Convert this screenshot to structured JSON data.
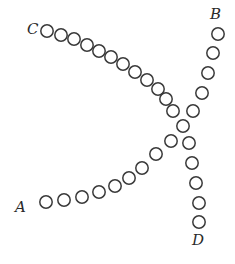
{
  "diagram": {
    "bead_radius": 6.2,
    "stroke_color": "#3a3a3a",
    "background": "#ffffff",
    "labels": [
      {
        "id": "C",
        "text": "C",
        "x": 27,
        "y": 22
      },
      {
        "id": "B",
        "text": "B",
        "x": 210,
        "y": 7
      },
      {
        "id": "A",
        "text": "A",
        "x": 15,
        "y": 200
      },
      {
        "id": "D",
        "text": "D",
        "x": 192,
        "y": 233
      }
    ],
    "arms": [
      {
        "name": "arm-c",
        "beads": [
          [
            47,
            31
          ],
          [
            61,
            35
          ],
          [
            74,
            39
          ],
          [
            87,
            45
          ],
          [
            99,
            51
          ],
          [
            111,
            57
          ],
          [
            123,
            64
          ],
          [
            135,
            72
          ],
          [
            147,
            80
          ],
          [
            158,
            89
          ],
          [
            166,
            99
          ],
          [
            173,
            111
          ]
        ]
      },
      {
        "name": "arm-b",
        "beads": [
          [
            218,
            34
          ],
          [
            213,
            53
          ],
          [
            208,
            73
          ],
          [
            202,
            93
          ],
          [
            193,
            111
          ]
        ]
      },
      {
        "name": "center",
        "beads": [
          [
            183,
            126
          ]
        ]
      },
      {
        "name": "arm-a",
        "beads": [
          [
            46,
            202
          ],
          [
            64,
            200
          ],
          [
            82,
            197
          ],
          [
            99,
            192
          ],
          [
            115,
            186
          ],
          [
            129,
            178
          ],
          [
            142,
            168
          ],
          [
            156,
            154
          ],
          [
            171,
            141
          ]
        ]
      },
      {
        "name": "arm-d",
        "beads": [
          [
            189,
            143
          ],
          [
            192,
            163
          ],
          [
            196,
            183
          ],
          [
            199,
            203
          ],
          [
            199,
            222
          ]
        ]
      }
    ]
  }
}
